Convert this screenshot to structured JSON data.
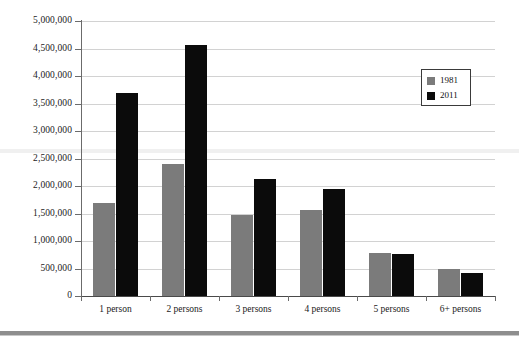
{
  "chart_data": {
    "type": "bar",
    "title": "",
    "xlabel": "",
    "ylabel": "",
    "categories": [
      "1 person",
      "2 persons",
      "3 persons",
      "4 persons",
      "5 persons",
      "6+ persons"
    ],
    "series": [
      {
        "name": "1981",
        "color": "#7b7b7b",
        "values": [
          1690000,
          2400000,
          1470000,
          1570000,
          785000,
          495000
        ]
      },
      {
        "name": "2011",
        "color": "#0b0b0b",
        "values": [
          3700000,
          4570000,
          2120000,
          1940000,
          765000,
          425000
        ]
      }
    ],
    "ylim": [
      0,
      5000000
    ],
    "ytick_values": [
      0,
      500000,
      1000000,
      1500000,
      2000000,
      2500000,
      3000000,
      3500000,
      4000000,
      4500000,
      5000000
    ],
    "ytick_labels": [
      "0",
      "500,000",
      "1,000,000",
      "1,500,000",
      "2,000,000",
      "2,500,000",
      "3,000,000",
      "3,500,000",
      "4,000,000",
      "4,500,000",
      "5,000,000"
    ],
    "grid": true,
    "grid_color": "#d2d2d2",
    "legend_position": "upper right",
    "axis_color": "#6b6b6b",
    "background": "#ffffff"
  },
  "legend": {
    "items": [
      {
        "label": "1981",
        "swatch": "#7b7b7b"
      },
      {
        "label": "2011",
        "swatch": "#0b0b0b"
      }
    ]
  }
}
